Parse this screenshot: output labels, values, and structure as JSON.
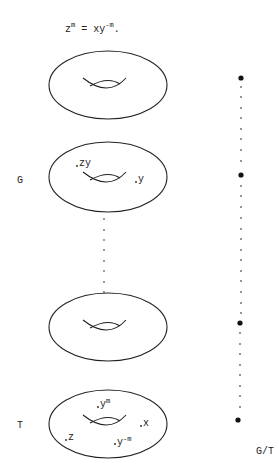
{
  "equation": {
    "lhs_base": "z",
    "lhs_exp": "m",
    "eq_sign": " = ",
    "rhs_base": "xy",
    "rhs_exp": "-m",
    "end": "."
  },
  "labels": {
    "group": "G",
    "torus": "T",
    "quotient": "G/T"
  },
  "tori": [
    {
      "id": "torus-1",
      "cx": 108,
      "cy": 85,
      "rx": 59,
      "ry": 34,
      "points": []
    },
    {
      "id": "torus-G",
      "cx": 108,
      "cy": 177,
      "rx": 59,
      "ry": 35,
      "points": [
        {
          "label": "zy"
        },
        {
          "label": "y"
        }
      ]
    },
    {
      "id": "torus-3",
      "cx": 108,
      "cy": 327,
      "rx": 59,
      "ry": 34,
      "points": []
    },
    {
      "id": "torus-T",
      "cx": 108,
      "cy": 424,
      "rx": 59,
      "ry": 34,
      "points": [
        {
          "label_base": "y",
          "label_exp": "m"
        },
        {
          "label": "x"
        },
        {
          "label": "z"
        },
        {
          "label_base": "y",
          "label_exp": "-m"
        }
      ]
    }
  ],
  "quotient_column": {
    "x": 241,
    "large_dots_y": [
      77,
      175,
      323,
      420
    ],
    "color": "#111111"
  },
  "ellipsis_column": {
    "x": 104,
    "y_start": 222,
    "y_end": 283,
    "count": 7
  }
}
